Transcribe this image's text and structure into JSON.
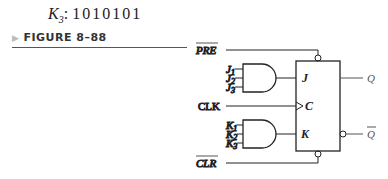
{
  "header": {
    "variable": "K",
    "subscript": "3",
    "sequence": "1010101"
  },
  "figure": {
    "label": "FIGURE 8–88"
  },
  "circuit": {
    "type": "J-K flip-flop with 3-input AND gates",
    "inputs": {
      "preset": "PRE",
      "j": [
        "J",
        "J",
        "J"
      ],
      "j_subs": [
        "1",
        "2",
        "3"
      ],
      "clock": "CLK",
      "k": [
        "K",
        "K",
        "K"
      ],
      "k_subs": [
        "1",
        "2",
        "3"
      ],
      "clear": "CLR"
    },
    "pins": {
      "j": "J",
      "c": "C",
      "k": "K"
    },
    "outputs": {
      "q": "Q",
      "q_bar": "Q"
    },
    "colors": {
      "line": "#222222",
      "label": "#555555"
    }
  }
}
